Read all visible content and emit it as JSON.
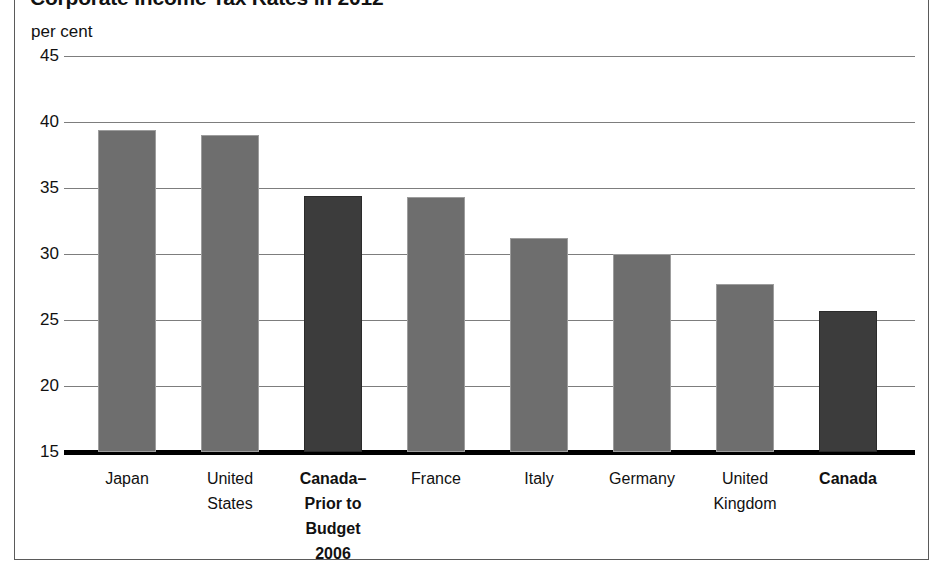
{
  "figure": {
    "title": "Corporate Income Tax Rates in 2012",
    "unit_label": "per cent"
  },
  "chart_data": {
    "type": "bar",
    "title": "Corporate Income Tax Rates in 2012",
    "xlabel": "",
    "ylabel": "per cent",
    "ylim": [
      15,
      45
    ],
    "ytick_step": 5,
    "yticks": [
      45,
      40,
      35,
      30,
      25,
      20,
      15
    ],
    "grid": true,
    "legend": "none",
    "categories": [
      "Japan",
      "United States",
      "Canada–Prior to Budget 2006",
      "France",
      "Italy",
      "Germany",
      "United Kingdom",
      "Canada"
    ],
    "category_lines": [
      [
        "Japan"
      ],
      [
        "United",
        "States"
      ],
      [
        "Canada–",
        "Prior to",
        "Budget",
        "2006"
      ],
      [
        "France"
      ],
      [
        "Italy"
      ],
      [
        "Germany"
      ],
      [
        "United",
        "Kingdom"
      ],
      [
        "Canada"
      ]
    ],
    "values": [
      39.4,
      39.0,
      34.4,
      34.3,
      31.2,
      30.0,
      27.7,
      25.7
    ],
    "highlighted": [
      false,
      false,
      true,
      false,
      false,
      false,
      false,
      true
    ],
    "colors": {
      "bar": "#6e6e6e",
      "bar_highlight": "#3c3c3c",
      "gridline": "#7d7d7d",
      "axis": "#000000",
      "frame": "#5a5a5a",
      "text": "#111111"
    }
  }
}
